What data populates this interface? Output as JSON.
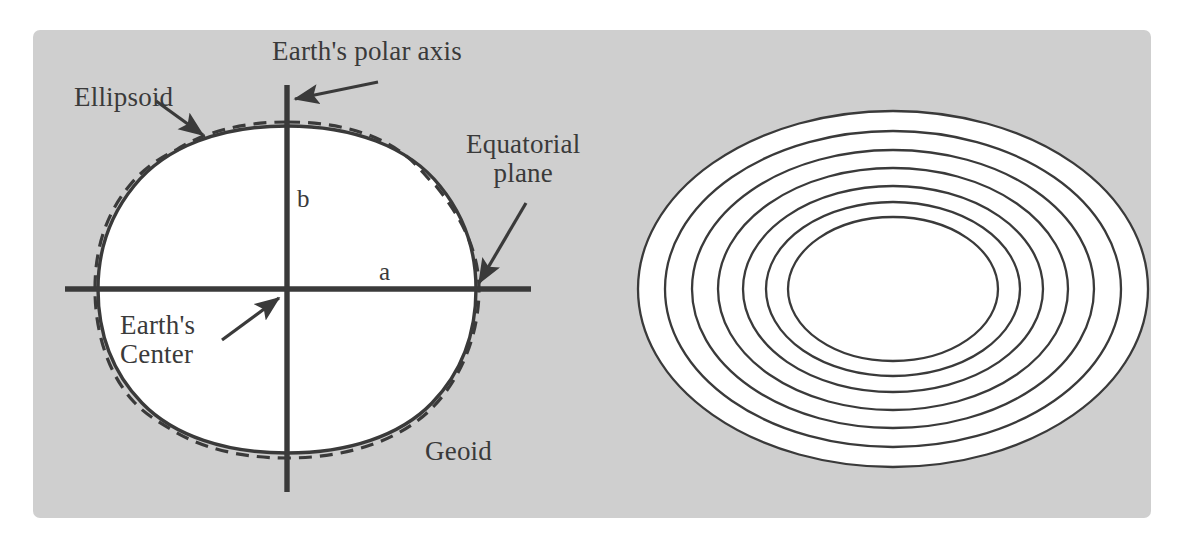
{
  "figure": {
    "caption": "",
    "panel_background": "#cfcfcf",
    "line_color": "#3a3a3a",
    "fill_color": "#ffffff",
    "labels": {
      "polar_axis": "Earth's polar axis",
      "ellipsoid": "Ellipsoid",
      "equatorial_plane_line1": "Equatorial",
      "equatorial_plane_line2": "plane",
      "semi_minor_axis": "b",
      "semi_major_axis": "a",
      "earths_center_line1": "Earth's",
      "earths_center_line2": "Center",
      "geoid": "Geoid"
    },
    "left_diagram": {
      "name": "geoid-vs-ellipsoid-cross-section",
      "ellipsoid_style": "solid",
      "geoid_style": "dashed",
      "axes": {
        "polar_axis_orientation": "vertical",
        "equatorial_plane_orientation": "horizontal",
        "center_x": 287,
        "center_y": 289
      }
    },
    "right_diagram": {
      "name": "concentric-equipotential-ellipses",
      "ellipse_count": 7,
      "style": "solid",
      "center_x": 893,
      "center_y": 289,
      "rx": [
        255,
        228,
        201,
        175,
        150,
        127,
        105
      ],
      "ry": [
        178,
        158,
        139,
        121,
        103,
        87,
        72
      ]
    }
  }
}
